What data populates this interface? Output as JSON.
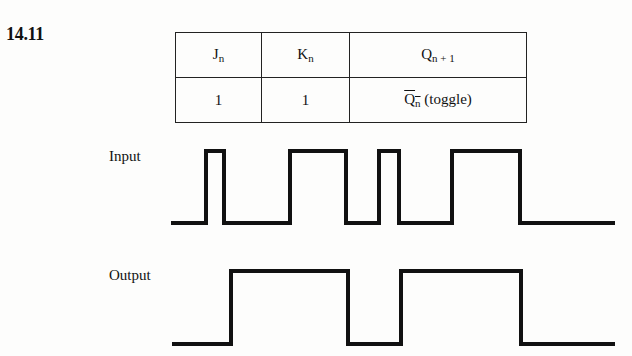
{
  "problem": {
    "number": "14.11"
  },
  "table": {
    "headers": [
      {
        "main": "J",
        "sub": "n"
      },
      {
        "main": "K",
        "sub": "n"
      },
      {
        "main": "Q",
        "sub": "n + 1"
      }
    ],
    "rows": [
      {
        "j": "1",
        "k": "1",
        "q_main": "Q",
        "q_sub": "n",
        "q_note": " (toggle)"
      }
    ]
  },
  "waveforms": {
    "input": {
      "label": "Input",
      "transitions_x": [
        171,
        206,
        224,
        290,
        346,
        379,
        399,
        452,
        520,
        615
      ],
      "levels": [
        0,
        1,
        0,
        1,
        0,
        1,
        0,
        1,
        0
      ]
    },
    "output": {
      "label": "Output",
      "transitions_x": [
        172,
        231,
        348,
        401,
        521,
        615
      ],
      "levels": [
        0,
        1,
        0,
        1,
        0
      ]
    }
  }
}
